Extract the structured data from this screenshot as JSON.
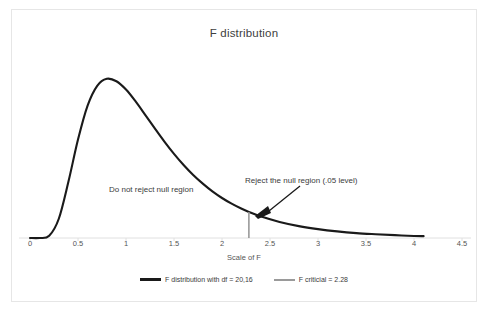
{
  "chart_data": {
    "type": "line",
    "title": "F distribution",
    "xlabel": "Scale of F",
    "ylabel": "",
    "xlim": [
      0,
      4.5
    ],
    "ylim": [
      0,
      0.88
    ],
    "grid": false,
    "legend_position": "bottom",
    "xticks": [
      "0",
      "0.5",
      "1",
      "1.5",
      "2",
      "2.5",
      "3",
      "3.5",
      "4",
      "4.5"
    ],
    "xtick_values": [
      0,
      0.5,
      1,
      1.5,
      2,
      2.5,
      3,
      3.5,
      4,
      4.5
    ],
    "series": [
      {
        "name": "F distribution with df = 20,16",
        "color": "#1a1a1a",
        "df1": 20,
        "df2": 16,
        "x": [
          0.0,
          0.1,
          0.2,
          0.3,
          0.4,
          0.5,
          0.6,
          0.7,
          0.8,
          0.9,
          1.0,
          1.1,
          1.2,
          1.3,
          1.4,
          1.5,
          1.6,
          1.7,
          1.8,
          1.9,
          2.0,
          2.1,
          2.2,
          2.28,
          2.4,
          2.6,
          2.8,
          3.0,
          3.2,
          3.4,
          3.6,
          3.8,
          4.0,
          4.1
        ],
        "y": [
          0.0,
          0.0,
          0.012,
          0.102,
          0.298,
          0.522,
          0.702,
          0.807,
          0.844,
          0.831,
          0.787,
          0.724,
          0.653,
          0.581,
          0.511,
          0.446,
          0.387,
          0.334,
          0.288,
          0.247,
          0.212,
          0.182,
          0.156,
          0.138,
          0.115,
          0.085,
          0.063,
          0.047,
          0.035,
          0.026,
          0.02,
          0.015,
          0.011,
          0.01
        ]
      },
      {
        "name": "F criticial = 2.28",
        "color": "#9a9a9a",
        "type": "vline",
        "value": 2.28,
        "y_top": 0.138
      }
    ],
    "annotations": [
      {
        "text": "Do not reject null region",
        "x": 0.85,
        "y": 0.34
      },
      {
        "text": "Reject the null region (.05 level)",
        "x": 2.42,
        "y": 0.42,
        "arrow_to_x": 2.37,
        "arrow_to_y": 0.12
      }
    ]
  },
  "legend": {
    "items": [
      {
        "label": "F distribution with df = 20,16"
      },
      {
        "label": "F criticial = 2.28"
      }
    ]
  }
}
